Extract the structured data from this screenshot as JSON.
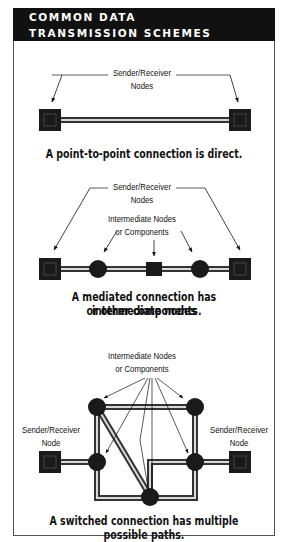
{
  "header": {
    "title_line1": "COMMON DATA",
    "title_line2": "TRANSMISSION SCHEMES"
  },
  "diagrams": [
    {
      "type": "point-to-point",
      "label_top": [
        "Sender/Receiver",
        "Nodes"
      ],
      "caption": "A point-to-point connection is direct."
    },
    {
      "type": "mediated",
      "label_top": [
        "Sender/Receiver",
        "Nodes"
      ],
      "label_middle": [
        "Intermediate Nodes",
        "or Components"
      ],
      "caption_line1": "A mediated connection has intermediate nodes",
      "caption_line2": "or other components."
    },
    {
      "type": "switched",
      "label_top": [
        "Intermediate Nodes",
        "or Components"
      ],
      "label_left": [
        "Sender/Receiver",
        "Node"
      ],
      "label_right": [
        "Sender/Receiver",
        "Node"
      ],
      "caption": "A switched connection has multiple possible paths."
    }
  ],
  "colors": {
    "header_bg": "#111111",
    "node": "#1a1a1a",
    "wire_outer": "#333333",
    "wire_inner": "#d8d8d8"
  }
}
